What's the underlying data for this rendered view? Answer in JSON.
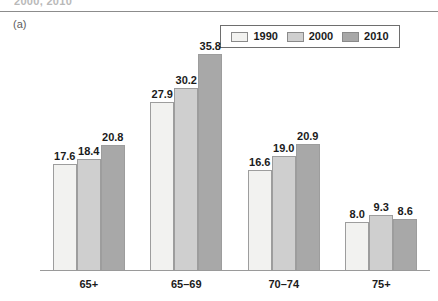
{
  "figure": {
    "clipped_running_head": "2000, 2010",
    "panel_letter": "(a)"
  },
  "legend": {
    "entries": [
      {
        "label": "1990",
        "color": "#f2f2f0"
      },
      {
        "label": "2000",
        "color": "#cfcfcf"
      },
      {
        "label": "2010",
        "color": "#a8a8a8"
      }
    ]
  },
  "chart_data": {
    "type": "bar",
    "title": "",
    "subtitle": "",
    "xlabel": "",
    "ylabel": "",
    "categories": [
      "65+",
      "65–69",
      "70–74",
      "75+"
    ],
    "series": [
      {
        "name": "1990",
        "color": "#f2f2f0",
        "values": [
          17.6,
          27.9,
          16.6,
          8.0
        ]
      },
      {
        "name": "2000",
        "color": "#cfcfcf",
        "values": [
          18.4,
          30.2,
          19.0,
          9.3
        ]
      },
      {
        "name": "2010",
        "color": "#a8a8a8",
        "values": [
          20.8,
          35.8,
          20.9,
          8.6
        ]
      }
    ],
    "value_labels": [
      [
        "17.6",
        "18.4",
        "20.8"
      ],
      [
        "27.9",
        "30.2",
        "35.8"
      ],
      [
        "16.6",
        "19.0",
        "20.9"
      ],
      [
        "8.0",
        "9.3",
        "8.6"
      ]
    ],
    "ylim": [
      0,
      40
    ],
    "grid": false,
    "legend_position": "top-right",
    "axis": {
      "baseline_visible": true,
      "y_axis_visible": false,
      "ticks_visible": false
    }
  }
}
